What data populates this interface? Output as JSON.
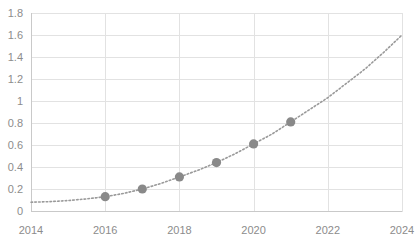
{
  "chart_data": {
    "type": "scatter",
    "title": "",
    "subtitle": "",
    "xlabel": "",
    "ylabel": "",
    "xlim": [
      2014,
      2024
    ],
    "ylim": [
      0,
      1.8
    ],
    "grid": true,
    "legend": "none",
    "x_ticks": [
      2014,
      2016,
      2018,
      2020,
      2022,
      2024
    ],
    "x_tick_labels": [
      "2014",
      "2016",
      "2018",
      "2020",
      "2022",
      "2024"
    ],
    "y_ticks": [
      0,
      0.2,
      0.4,
      0.6,
      0.8,
      1,
      1.2,
      1.4,
      1.6,
      1.8
    ],
    "y_tick_labels": [
      "0",
      "0.2",
      "0.4",
      "0.6",
      "0.8",
      "1",
      "1.2",
      "1.4",
      "1.6",
      "1.8"
    ],
    "series": [
      {
        "name": "data points",
        "style": "markers",
        "color": "#898989",
        "x": [
          2016,
          2017,
          2018,
          2019,
          2020,
          2021
        ],
        "values": [
          0.13,
          0.2,
          0.31,
          0.44,
          0.61,
          0.81
        ]
      },
      {
        "name": "trend curve",
        "style": "dotted-line",
        "color": "#9a9a9a",
        "x": [
          2014,
          2014.5,
          2015,
          2015.5,
          2016,
          2016.5,
          2017,
          2017.5,
          2018,
          2018.5,
          2019,
          2019.5,
          2020,
          2020.5,
          2021,
          2021.5,
          2022,
          2022.5,
          2023,
          2023.5,
          2024
        ],
        "values": [
          0.08,
          0.085,
          0.095,
          0.11,
          0.13,
          0.16,
          0.2,
          0.25,
          0.31,
          0.37,
          0.44,
          0.52,
          0.61,
          0.7,
          0.81,
          0.92,
          1.03,
          1.16,
          1.29,
          1.44,
          1.6
        ]
      }
    ]
  },
  "plot": {
    "left": 31,
    "right": 402,
    "top": 13,
    "bottom": 211
  },
  "colors": {
    "marker": "#898989",
    "curve": "#9a9a9a",
    "grid": "#e2e2e2",
    "axis": "#c9c9c9",
    "label": "#8c8c8c",
    "background": "#ffffff"
  }
}
